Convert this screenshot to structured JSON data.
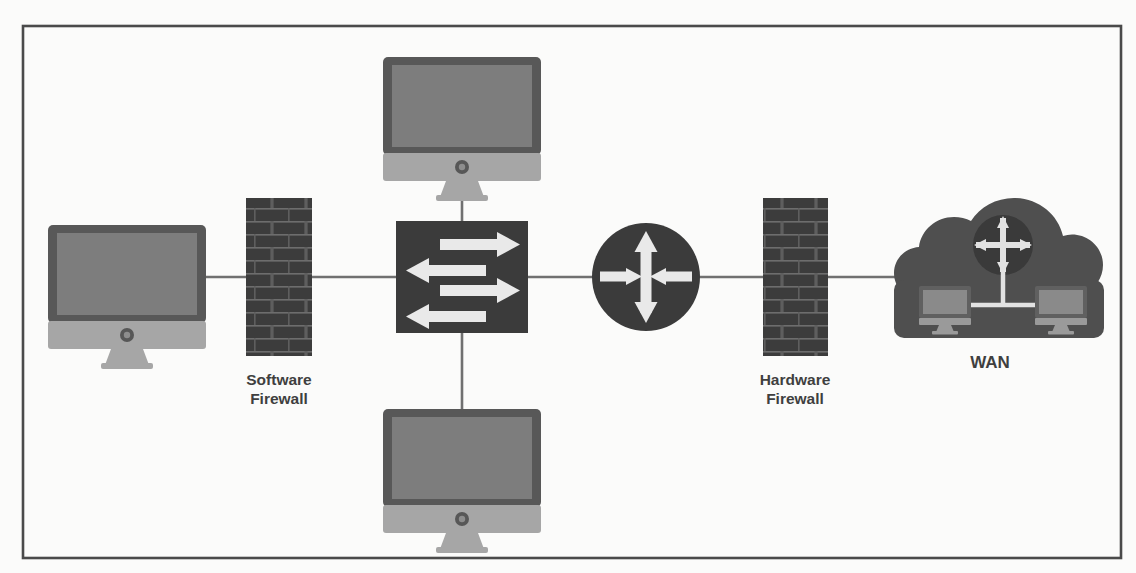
{
  "diagram": {
    "background_color": "#fbfbfa",
    "frame_color": "#4a4a4a",
    "line_color": "#707070",
    "device_dark_color": "#3f3f3f",
    "device_mid_color": "#6e6e6e",
    "device_light_color": "#a9a9a9",
    "arrow_color": "#e9e9e9",
    "label_color": "#3f3f3f",
    "nodes": [
      {
        "id": "left-workstation",
        "type": "monitor",
        "label": "",
        "x": 127,
        "y": 288
      },
      {
        "id": "software-firewall",
        "type": "firewall",
        "label": "Software\nFirewall",
        "label_line1": "Software",
        "label_line2": "Firewall",
        "x": 279,
        "y": 277
      },
      {
        "id": "switch",
        "type": "switch",
        "label": "",
        "x": 462,
        "y": 277
      },
      {
        "id": "top-workstation",
        "type": "monitor",
        "label": "",
        "x": 462,
        "y": 120
      },
      {
        "id": "bottom-workstation",
        "type": "monitor",
        "label": "",
        "x": 462,
        "y": 472
      },
      {
        "id": "router",
        "type": "router",
        "label": "",
        "x": 646,
        "y": 277
      },
      {
        "id": "hardware-firewall",
        "type": "firewall",
        "label": "Hardware\nFirewall",
        "label_line1": "Hardware",
        "label_line2": "Firewall",
        "x": 795,
        "y": 277
      },
      {
        "id": "wan-cloud",
        "type": "cloud",
        "label": "WAN",
        "x": 990,
        "y": 277
      }
    ],
    "links": [
      {
        "from": "left-workstation",
        "to": "software-firewall"
      },
      {
        "from": "software-firewall",
        "to": "switch"
      },
      {
        "from": "switch",
        "to": "top-workstation"
      },
      {
        "from": "switch",
        "to": "bottom-workstation"
      },
      {
        "from": "switch",
        "to": "router"
      },
      {
        "from": "router",
        "to": "hardware-firewall"
      },
      {
        "from": "hardware-firewall",
        "to": "wan-cloud"
      }
    ],
    "labels": {
      "software_firewall_line1": "Software",
      "software_firewall_line2": "Firewall",
      "hardware_firewall_line1": "Hardware",
      "hardware_firewall_line2": "Firewall",
      "wan": "WAN"
    },
    "switch_arrows": [
      {
        "direction": "right",
        "order": 1
      },
      {
        "direction": "left",
        "order": 2
      },
      {
        "direction": "right",
        "order": 3
      },
      {
        "direction": "left",
        "order": 4
      }
    ],
    "router_arrows": [
      {
        "direction": "up"
      },
      {
        "direction": "down"
      },
      {
        "direction": "right-inward"
      },
      {
        "direction": "left-inward"
      }
    ]
  }
}
